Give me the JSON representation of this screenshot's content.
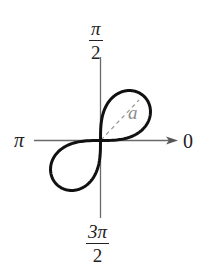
{
  "diagram": {
    "type": "polar-graph",
    "curve": "lemniscate",
    "equation_form": "r^2 = a^2 sin 2θ",
    "labels": {
      "top": {
        "numerator": "π",
        "denominator": "2"
      },
      "bottom": {
        "numerator": "3π",
        "denominator": "2"
      },
      "left": "π",
      "right": "0",
      "loop_parameter": "a"
    },
    "colors": {
      "curve": "#111111",
      "axis": "#555555",
      "dashed": "#999999",
      "text": "#222222"
    }
  }
}
